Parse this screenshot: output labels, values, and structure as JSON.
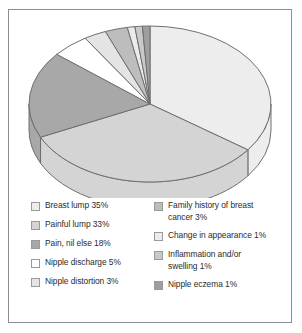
{
  "chart_data": {
    "type": "pie",
    "title": "",
    "subtitle": "",
    "xlabel": "",
    "ylabel": "",
    "legend_position": "bottom",
    "grid": false,
    "three_d": true,
    "start_angle_deg": 0,
    "direction": "clockwise",
    "categories": [
      "Breast lump",
      "Painful lump",
      "Pain, nil else",
      "Nipple discharge",
      "Nipple distortion",
      "Family history of breast cancer",
      "Change in appearance",
      "Inflammation and/or swelling",
      "Nipple eczema"
    ],
    "values": [
      35,
      33,
      18,
      5,
      3,
      3,
      1,
      1,
      1
    ],
    "unit": "%",
    "colors": [
      "#ededed",
      "#d4d4d4",
      "#a8a8a8",
      "#ffffff",
      "#e4e4e4",
      "#bdbdbd",
      "#ebebeb",
      "#c9c9c9",
      "#9e9e9e"
    ],
    "slice_labels": [
      "Breast lump 35%",
      "Painful lump 33%",
      "Pain, nil else 18%",
      "Nipple discharge 5%",
      "Nipple distortion 3%",
      "Family history of breast cancer 3%",
      "Change in appearance 1%",
      "Inflammation and/or swelling 1%",
      "Nipple eczema 1%"
    ]
  },
  "legend": {
    "left_column": [
      {
        "label": "Breast lump 35%",
        "color": "#ededed"
      },
      {
        "label": "Painful lump 33%",
        "color": "#d4d4d4"
      },
      {
        "label": "Pain, nil else 18%",
        "color": "#a8a8a8"
      },
      {
        "label": "Nipple discharge 5%",
        "color": "#ffffff"
      },
      {
        "label": "Nipple distortion 3%",
        "color": "#e4e4e4"
      }
    ],
    "right_column": [
      {
        "label": "Family history of breast\ncancer 3%",
        "color": "#bdbdbd"
      },
      {
        "label": "Change in appearance 1%",
        "color": "#ebebeb"
      },
      {
        "label": "Inflammation and/or\nswelling 1%",
        "color": "#c9c9c9"
      },
      {
        "label": "Nipple eczema 1%",
        "color": "#9e9e9e"
      }
    ]
  },
  "style": {
    "border_color": "#8e8e8e",
    "background": "#ffffff",
    "outline_color": "#6f6f6f",
    "text_color": "#2b2b2b"
  }
}
